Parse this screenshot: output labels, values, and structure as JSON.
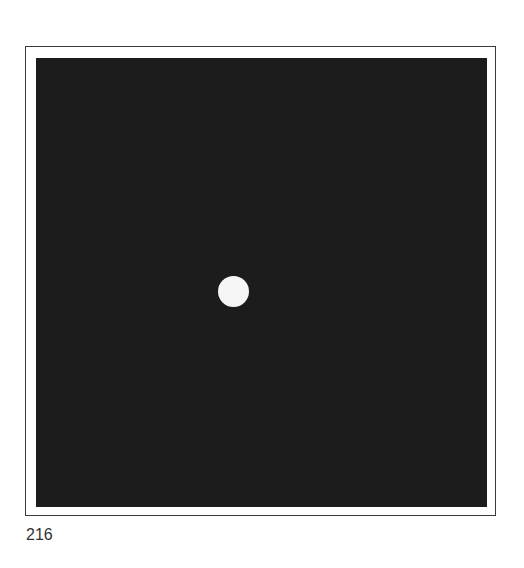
{
  "figure": {
    "frame_color": "#3a3a3a",
    "plate_color": "#1c1c1c",
    "dot_color": "#f6f6f6"
  },
  "page": {
    "number": "216"
  }
}
